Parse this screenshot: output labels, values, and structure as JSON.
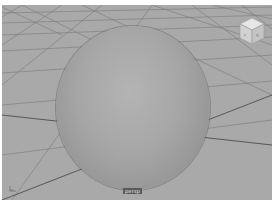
{
  "viewport": {
    "camera_label": "persp",
    "background_color": "#a9a9a9",
    "grid_line_color": "#6e6e6e",
    "object": {
      "type": "sphere",
      "color": "#a6a6a6"
    },
    "viewcube": {
      "icon": "viewcube-icon"
    },
    "axis_indicator": {
      "icon": "axis-gizmo-icon"
    }
  }
}
